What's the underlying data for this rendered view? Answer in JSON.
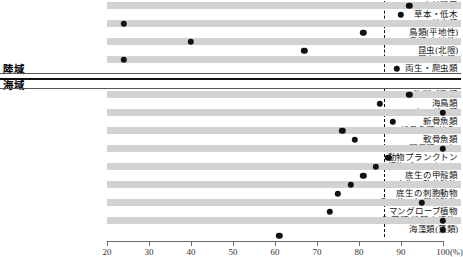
{
  "chart_data": {
    "type": "scatter",
    "title": "",
    "xlabel": "(%)",
    "ylabel": "",
    "xlim": [
      20,
      100
    ],
    "xticks": [
      20,
      30,
      40,
      50,
      60,
      70,
      80,
      90,
      100
    ],
    "xtick_labels": [
      "20",
      "30",
      "40",
      "50",
      "60",
      "70",
      "80",
      "90",
      "100"
    ],
    "unit_label": "(%)",
    "grid": false,
    "legend": null,
    "reference_line": 86,
    "sections": [
      {
        "name": "陸域",
        "categories": [
          "森林限界",
          "草本・低木",
          "地衣類",
          "鳥類(平地性)",
          "鳥類(山地性)",
          "昆虫(北限)",
          "昆虫(南限)",
          "両生・爬虫類"
        ],
        "values": [
          92,
          90,
          24,
          81,
          40,
          67,
          24,
          89
        ]
      },
      {
        "name": "海域",
        "categories": [
          "海獣哺乳類",
          "海鳥類",
          "ウミガメ類",
          "新骨魚類",
          "新骨魚類(幼魚)",
          "軟骨魚類",
          "頭足類(イカ)",
          "動物プランクトン",
          "植物プランクトン",
          "底生の甲殻類",
          "底生の軟体動物",
          "底生の刺胞動物",
          "その他の無脊椎動物",
          "マングローブ植物",
          "海草類(維管束植物)",
          "海藻類(藻類)"
        ],
        "values": [
          92,
          85,
          100,
          88,
          76,
          79,
          100,
          87,
          84,
          81,
          78,
          75,
          95,
          73,
          100,
          100
        ]
      }
    ],
    "axis_bottom_value": 61
  },
  "colors": {
    "band": "#d2d2d2",
    "dot": "#111111",
    "rule": "#555555",
    "reference": "#111111"
  }
}
